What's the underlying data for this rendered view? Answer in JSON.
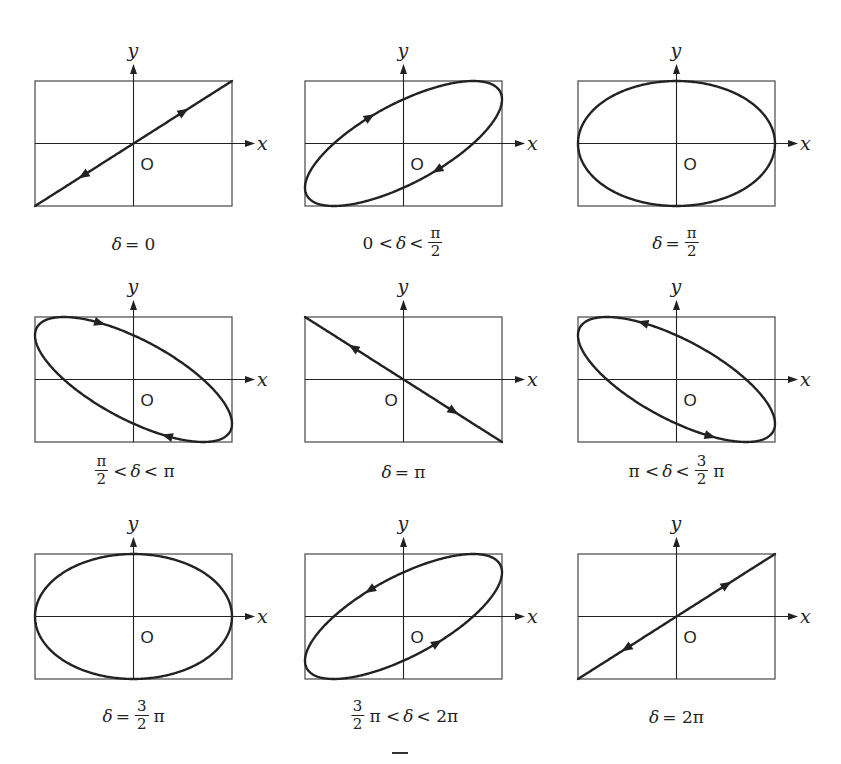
{
  "figure": {
    "axis_labels": {
      "x": "x",
      "y": "y",
      "origin": "O"
    },
    "line_color": "#222222",
    "frame_color": "#555555",
    "panels": [
      {
        "id": "delta-0",
        "shape": "line",
        "phase_over_pi": 0.0,
        "arrows": "forward",
        "caption": [
          {
            "t": "it",
            "v": "δ"
          },
          {
            "t": "txt",
            "v": "= 0"
          }
        ]
      },
      {
        "id": "delta-0-to-half-pi",
        "shape": "ellipse",
        "phase_over_pi": 0.25,
        "arrows": "forward",
        "caption": [
          {
            "t": "txt",
            "v": "0 <"
          },
          {
            "t": "it",
            "v": "δ"
          },
          {
            "t": "txt",
            "v": "<"
          },
          {
            "t": "frac",
            "num": "π",
            "den": "2"
          }
        ]
      },
      {
        "id": "delta-half-pi",
        "shape": "ellipse",
        "phase_over_pi": 0.5,
        "arrows": "none",
        "caption": [
          {
            "t": "it",
            "v": "δ"
          },
          {
            "t": "txt",
            "v": "="
          },
          {
            "t": "frac",
            "num": "π",
            "den": "2"
          }
        ]
      },
      {
        "id": "delta-half-pi-to-pi",
        "shape": "ellipse",
        "phase_over_pi": 0.75,
        "arrows": "forward",
        "caption": [
          {
            "t": "frac",
            "num": "π",
            "den": "2"
          },
          {
            "t": "txt",
            "v": "<"
          },
          {
            "t": "it",
            "v": "δ"
          },
          {
            "t": "txt",
            "v": "< π"
          }
        ]
      },
      {
        "id": "delta-pi",
        "shape": "line",
        "phase_over_pi": 1.0,
        "arrows": "forward",
        "origin_side": "left",
        "caption": [
          {
            "t": "it",
            "v": "δ"
          },
          {
            "t": "txt",
            "v": "= π"
          }
        ]
      },
      {
        "id": "delta-pi-to-3half-pi",
        "shape": "ellipse",
        "phase_over_pi": 1.25,
        "arrows": "forward",
        "caption": [
          {
            "t": "txt",
            "v": "π <"
          },
          {
            "t": "it",
            "v": "δ"
          },
          {
            "t": "txt",
            "v": "<"
          },
          {
            "t": "frac",
            "num": "3",
            "den": "2"
          },
          {
            "t": "txt",
            "v": "π"
          }
        ]
      },
      {
        "id": "delta-3half-pi",
        "shape": "ellipse",
        "phase_over_pi": 1.5,
        "arrows": "none",
        "caption": [
          {
            "t": "it",
            "v": "δ"
          },
          {
            "t": "txt",
            "v": "="
          },
          {
            "t": "frac",
            "num": "3",
            "den": "2"
          },
          {
            "t": "txt",
            "v": "π"
          }
        ]
      },
      {
        "id": "delta-3half-pi-to-2pi",
        "shape": "ellipse",
        "phase_over_pi": 1.75,
        "arrows": "forward",
        "caption": [
          {
            "t": "frac",
            "num": "3",
            "den": "2"
          },
          {
            "t": "txt",
            "v": "π <"
          },
          {
            "t": "it",
            "v": "δ"
          },
          {
            "t": "txt",
            "v": "< 2π"
          }
        ]
      },
      {
        "id": "delta-2pi",
        "shape": "line",
        "phase_over_pi": 2.0,
        "arrows": "forward",
        "caption": [
          {
            "t": "it",
            "v": "δ"
          },
          {
            "t": "txt",
            "v": "= 2π"
          }
        ]
      }
    ]
  }
}
